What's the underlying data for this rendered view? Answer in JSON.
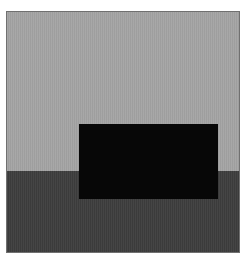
{
  "image": {
    "description": "Abstract composition: light gray upper field, dark gray lower field, black rectangle spanning the horizon",
    "colors": {
      "background": "#ffffff",
      "frame_border": "#707070",
      "upper_field": "#a4a4a4",
      "lower_field": "#3e3e3e",
      "block": "#070707"
    },
    "regions": [
      {
        "name": "upper-field",
        "label": "light gray area"
      },
      {
        "name": "lower-field",
        "label": "dark gray area"
      },
      {
        "name": "black-rectangle",
        "label": "black rectangle"
      }
    ]
  }
}
